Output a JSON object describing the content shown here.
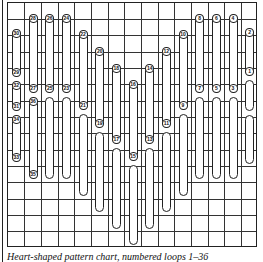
{
  "figure": {
    "grid": {
      "columns": 15,
      "rows": 15,
      "line_color": "#333333"
    },
    "caption": "Heart-shaped pattern chart, numbered loops 1–36"
  },
  "bars": [
    {
      "col": 1,
      "top_label": "30",
      "bottom_label": "29",
      "top": 28,
      "bottom": 76
    },
    {
      "col": 1,
      "top_label": "32",
      "bottom_label": "31",
      "top": 80,
      "bottom": 110
    },
    {
      "col": 1,
      "top_label": "34",
      "bottom_label": "33",
      "top": 114,
      "bottom": 161
    },
    {
      "col": 2,
      "top_label": "28",
      "bottom_label": "27",
      "top": 13,
      "bottom": 92
    },
    {
      "col": 2,
      "top_label": "36",
      "bottom_label": "35",
      "top": 96,
      "bottom": 178
    },
    {
      "col": 3,
      "top_label": "26",
      "bottom_label": "25",
      "top": 13,
      "bottom": 92
    },
    {
      "col": 3,
      "top_label": "",
      "bottom_label": "",
      "top": 96,
      "bottom": 178,
      "open_top": true
    },
    {
      "col": 4,
      "top_label": "24",
      "bottom_label": "23",
      "top": 13,
      "bottom": 92
    },
    {
      "col": 4,
      "top_label": "",
      "bottom_label": "",
      "top": 96,
      "bottom": 178,
      "open_top": true
    },
    {
      "col": 5,
      "top_label": "22",
      "bottom_label": "21",
      "top": 29,
      "bottom": 109
    },
    {
      "col": 5,
      "top_label": "",
      "bottom_label": "",
      "top": 113,
      "bottom": 195,
      "open_top": true
    },
    {
      "col": 6,
      "top_label": "20",
      "bottom_label": "19",
      "top": 46,
      "bottom": 127
    },
    {
      "col": 6,
      "top_label": "",
      "bottom_label": "",
      "top": 131,
      "bottom": 211,
      "open_top": true
    },
    {
      "col": 7,
      "top_label": "18",
      "bottom_label": "17",
      "top": 63,
      "bottom": 143
    },
    {
      "col": 7,
      "top_label": "",
      "bottom_label": "",
      "top": 147,
      "bottom": 228,
      "open_top": true
    },
    {
      "col": 8,
      "top_label": "16",
      "bottom_label": "15",
      "top": 79,
      "bottom": 160
    },
    {
      "col": 8,
      "top_label": "",
      "bottom_label": "",
      "top": 164,
      "bottom": 244,
      "open_top": true
    },
    {
      "col": 9,
      "top_label": "14",
      "bottom_label": "13",
      "top": 63,
      "bottom": 143
    },
    {
      "col": 9,
      "top_label": "",
      "bottom_label": "",
      "top": 147,
      "bottom": 228,
      "open_top": true
    },
    {
      "col": 10,
      "top_label": "12",
      "bottom_label": "11",
      "top": 46,
      "bottom": 127
    },
    {
      "col": 10,
      "top_label": "",
      "bottom_label": "",
      "top": 131,
      "bottom": 211,
      "open_top": true
    },
    {
      "col": 11,
      "top_label": "10",
      "bottom_label": "9",
      "top": 29,
      "bottom": 109
    },
    {
      "col": 11,
      "top_label": "",
      "bottom_label": "",
      "top": 113,
      "bottom": 195,
      "open_top": true
    },
    {
      "col": 12,
      "top_label": "8",
      "bottom_label": "7",
      "top": 13,
      "bottom": 92
    },
    {
      "col": 12,
      "top_label": "",
      "bottom_label": "",
      "top": 96,
      "bottom": 178,
      "open_top": true
    },
    {
      "col": 13,
      "top_label": "6",
      "bottom_label": "5",
      "top": 13,
      "bottom": 92
    },
    {
      "col": 13,
      "top_label": "",
      "bottom_label": "",
      "top": 96,
      "bottom": 178,
      "open_top": true
    },
    {
      "col": 14,
      "top_label": "4",
      "bottom_label": "3",
      "top": 13,
      "bottom": 92
    },
    {
      "col": 14,
      "top_label": "",
      "bottom_label": "",
      "top": 96,
      "bottom": 178,
      "open_top": true
    },
    {
      "col": 15,
      "top_label": "2",
      "bottom_label": "1",
      "top": 27,
      "bottom": 75
    },
    {
      "col": 15,
      "top_label": "",
      "bottom_label": "",
      "top": 79,
      "bottom": 110,
      "open_top": true
    },
    {
      "col": 15,
      "top_label": "",
      "bottom_label": "",
      "top": 114,
      "bottom": 163,
      "open_top": true
    }
  ]
}
